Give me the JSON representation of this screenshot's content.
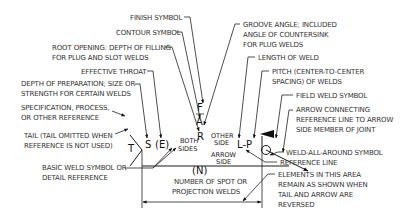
{
  "diagram": {
    "symbols": {
      "F": "F",
      "A": "A",
      "R": "R",
      "S": "S",
      "E": "(E)",
      "T": "T",
      "LP": "L-P",
      "N": "(N)",
      "both_top": "BOTH",
      "both_bottom": "SIDES",
      "other_top": "OTHER",
      "other_bottom": "SIDE",
      "arrow_top": "ARROW",
      "arrow_bottom": "SIDE"
    },
    "labels": {
      "finish_symbol": "FINISH SYMBOL",
      "contour_symbol": "CONTOUR SYMBOL",
      "root_opening_1": "ROOT OPENING: DEPTH OF FILLING",
      "root_opening_2": "FOR PLUG AND SLOT WELDS",
      "effective_throat": "EFFECTIVE THROAT",
      "depth_prep_1": "DEPTH OF PREPARATION; SIZE OR",
      "depth_prep_2": "STRENGTH FOR CERTAIN WELDS",
      "spec_1": "SPECIFICATION, PROCESS,",
      "spec_2": "OR OTHER REFERENCE",
      "tail_1": "TAIL (TAIL OMITTED WHEN",
      "tail_2": "REFERENCE IS NOT USED)",
      "basic_1": "BASIC WELD SYMBOL OR",
      "basic_2": "DETAIL REFERENCE",
      "spot_1": "NUMBER OF SPOT OR",
      "spot_2": "PROJECTION WELDS",
      "groove_1": "GROOVE ANGLE; INCLUDED",
      "groove_2": "ANGLE OF COUNTERSINK",
      "groove_3": "FOR PLUG WELDS",
      "length": "LENGTH OF WELD",
      "pitch_1": "PITCH (CENTER-TO-CENTER",
      "pitch_2": "SPACING) OF WELDS",
      "field_weld": "FIELD WELD SYMBOL",
      "arrow_conn_1": "ARROW CONNECTING",
      "arrow_conn_2": "REFERENCE LINE TO ARROW",
      "arrow_conn_3": "SIDE MEMBER OF JOINT",
      "weld_all_around": "WELD-ALL-AROUND SYMBOL",
      "reference_line": "REFERENCE LINE",
      "elements_1": "ELEMENTS IN THIS AREA",
      "elements_2": "REMAIN AS SHOWN WHEN",
      "elements_3": "TAIL AND ARROW ARE",
      "elements_4": "REVERSED"
    }
  }
}
